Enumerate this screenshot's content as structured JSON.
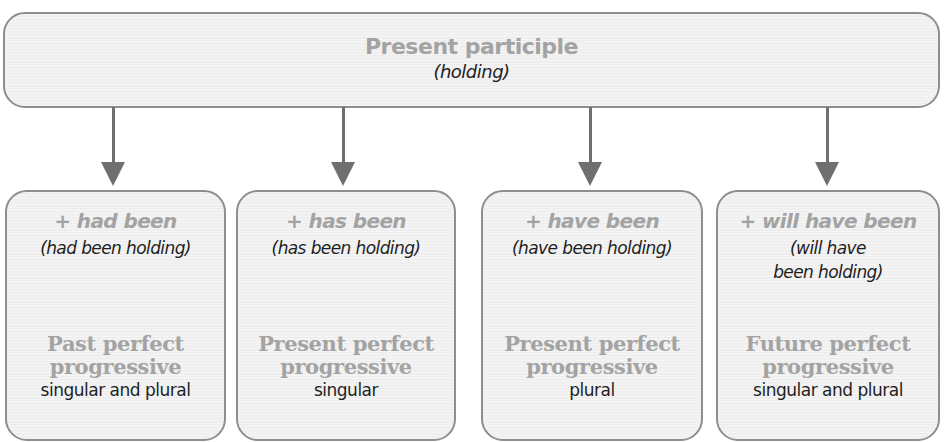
{
  "header_box": {
    "title": "Present participle",
    "example": "(holding)"
  },
  "colors": {
    "box_fill": "#f1f1f1",
    "box_border": "#8e8e8e",
    "heading_gray": "#a3a3a3",
    "body_text": "#1e1e1e",
    "arrow": "#6f6f6f"
  },
  "branches": [
    {
      "auxiliary": "+ had been",
      "example_line1": "(had been holding)",
      "example_line2": "",
      "tense_line1": "Past perfect",
      "tense_line2": "progressive",
      "number": "singular and plural"
    },
    {
      "auxiliary": "+ has been",
      "example_line1": "(has been holding)",
      "example_line2": "",
      "tense_line1": "Present perfect",
      "tense_line2": "progressive",
      "number": "singular"
    },
    {
      "auxiliary": "+ have been",
      "example_line1": "(have been holding)",
      "example_line2": "",
      "tense_line1": "Present perfect",
      "tense_line2": "progressive",
      "number": "plural"
    },
    {
      "auxiliary": "+ will have been",
      "example_line1": "(will have",
      "example_line2": "been holding)",
      "tense_line1": "Future perfect",
      "tense_line2": "progressive",
      "number": "singular and plural"
    }
  ]
}
